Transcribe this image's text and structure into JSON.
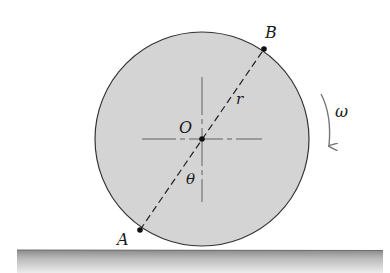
{
  "diagram": {
    "type": "rolling-disk",
    "labels": {
      "point_a": "A",
      "point_b": "B",
      "center": "O",
      "radius": "r",
      "angle": "θ",
      "angular_velocity": "ω"
    },
    "colors": {
      "disk_fill": "#d4d4d4",
      "disk_stroke": "#333333",
      "ground_top": "#8a8a8a",
      "ground_bottom": "#e8e8e8",
      "line": "#222222",
      "arrow": "#777777"
    }
  }
}
